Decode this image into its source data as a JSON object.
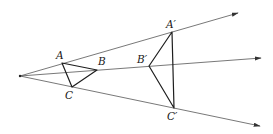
{
  "diagram": {
    "type": "geometric-dilation",
    "center": {
      "x": 20,
      "y": 76
    },
    "rays": [
      {
        "name": "ray-through-A",
        "end": {
          "x": 238,
          "y": 13
        }
      },
      {
        "name": "ray-through-B",
        "end": {
          "x": 261,
          "y": 58
        }
      },
      {
        "name": "ray-through-C",
        "end": {
          "x": 260,
          "y": 126
        }
      }
    ],
    "original_triangle": {
      "points": {
        "A": {
          "x": 62,
          "y": 63
        },
        "B": {
          "x": 97,
          "y": 70
        },
        "C": {
          "x": 72,
          "y": 87
        }
      }
    },
    "image_triangle": {
      "points": {
        "A'": {
          "x": 172,
          "y": 32
        },
        "B'": {
          "x": 149,
          "y": 66
        },
        "C'": {
          "x": 174,
          "y": 108
        }
      }
    },
    "labels": {
      "A": "A",
      "B": "B",
      "C": "C",
      "A_prime": "A′",
      "B_prime": "B′",
      "C_prime": "C′"
    },
    "colors": {
      "rays": "#555555",
      "triangles": "#1e1e1e",
      "labels": "#1a1a1a",
      "background": "#ffffff"
    }
  }
}
